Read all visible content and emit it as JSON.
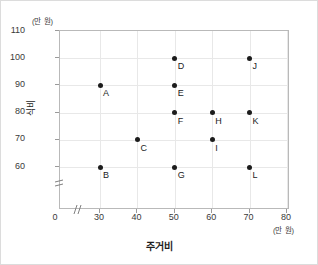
{
  "chart_data": {
    "type": "scatter",
    "title": "",
    "xlabel": "주거비",
    "ylabel": "식비",
    "x_unit": "(만 원)",
    "y_unit": "(만 원)",
    "xlim": [
      20,
      80
    ],
    "ylim": [
      55,
      110
    ],
    "x_ticks": [
      0,
      30,
      40,
      50,
      60,
      70,
      80
    ],
    "y_ticks": [
      60,
      70,
      80,
      90,
      100,
      110
    ],
    "grid": true,
    "legend": "none",
    "axis_break_x": true,
    "axis_break_y": true,
    "origin_label": "0",
    "points": [
      {
        "label": "A",
        "x": 30,
        "y": 90
      },
      {
        "label": "B",
        "x": 30,
        "y": 60
      },
      {
        "label": "C",
        "x": 40,
        "y": 70
      },
      {
        "label": "D",
        "x": 50,
        "y": 100
      },
      {
        "label": "E",
        "x": 50,
        "y": 90
      },
      {
        "label": "F",
        "x": 50,
        "y": 80
      },
      {
        "label": "G",
        "x": 50,
        "y": 60
      },
      {
        "label": "H",
        "x": 60,
        "y": 80
      },
      {
        "label": "I",
        "x": 60,
        "y": 70
      },
      {
        "label": "J",
        "x": 70,
        "y": 100
      },
      {
        "label": "K",
        "x": 70,
        "y": 80
      },
      {
        "label": "L",
        "x": 70,
        "y": 60
      }
    ],
    "point_color": "#1c1c1c",
    "grid_color": "#e8e8e8",
    "frame_color": "#b9b9b9"
  }
}
